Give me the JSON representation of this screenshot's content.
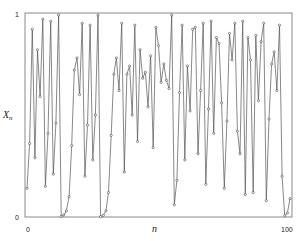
{
  "chart_data": {
    "type": "line",
    "title": "",
    "xlabel": "n",
    "ylabel": "X",
    "ylabel_sub": "n",
    "xlim": [
      0,
      100
    ],
    "ylim": [
      0,
      1
    ],
    "x_ticks": [
      "0",
      "100"
    ],
    "y_ticks": [
      "0",
      "1"
    ],
    "grid": false,
    "legend": "none",
    "series": [
      {
        "name": "X_n",
        "marker": "circle",
        "color": "#555555",
        "x": [
          0,
          1,
          2,
          3,
          4,
          5,
          6,
          7,
          8,
          9,
          10,
          11,
          12,
          13,
          14,
          15,
          16,
          17,
          18,
          19,
          20,
          21,
          22,
          23,
          24,
          25,
          26,
          27,
          28,
          29,
          30,
          31,
          32,
          33,
          34,
          35,
          36,
          37,
          38,
          39,
          40,
          41,
          42,
          43,
          44,
          45,
          46,
          47,
          48,
          49,
          50,
          51,
          52,
          53,
          54,
          55,
          56,
          57,
          58,
          59,
          60,
          61,
          62,
          63,
          64,
          65,
          66,
          67,
          68,
          69,
          70,
          71,
          72,
          73,
          74,
          75,
          76,
          77,
          78,
          79,
          80,
          81,
          82,
          83,
          84,
          85,
          86,
          87,
          88,
          89,
          90,
          91,
          92,
          93,
          94,
          95,
          96,
          97,
          98,
          99,
          100
        ],
        "values": [
          0.14,
          0.36,
          0.92,
          0.29,
          0.82,
          0.59,
          0.97,
          0.15,
          0.41,
          0.96,
          0.21,
          0.46,
          0.99,
          0.003,
          0.01,
          0.03,
          0.1,
          0.35,
          0.72,
          0.78,
          0.6,
          0.95,
          0.2,
          0.45,
          0.94,
          0.28,
          0.5,
          0.99,
          0.002,
          0.008,
          0.03,
          0.12,
          0.4,
          0.7,
          0.78,
          0.62,
          0.95,
          0.22,
          0.7,
          0.74,
          0.5,
          0.94,
          0.37,
          0.82,
          0.68,
          0.71,
          0.54,
          0.79,
          0.34,
          0.93,
          0.84,
          0.66,
          0.75,
          0.67,
          0.63,
          0.99,
          0.06,
          0.18,
          0.61,
          0.94,
          0.28,
          0.74,
          0.52,
          0.92,
          0.93,
          0.31,
          0.62,
          0.95,
          0.16,
          0.53,
          0.96,
          0.41,
          0.88,
          0.85,
          0.56,
          0.14,
          0.47,
          0.9,
          0.77,
          0.95,
          0.42,
          0.31,
          0.96,
          0.11,
          0.88,
          0.77,
          0.12,
          0.89,
          0.57,
          0.86,
          0.95,
          0.08,
          0.48,
          0.75,
          0.81,
          0.62,
          0.94,
          0.2,
          0.006,
          0.02,
          0.09
        ]
      }
    ],
    "vertical_lines_note": ""
  }
}
